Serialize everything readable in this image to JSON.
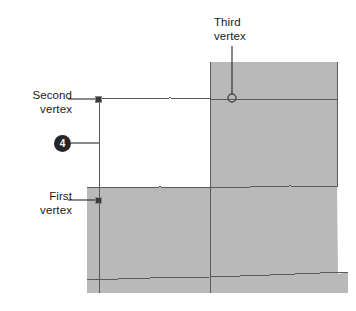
{
  "diagram": {
    "background_color": "#ffffff",
    "shape_fill_color": "#b9b9b9",
    "line_color": "#555555",
    "label_color": "#1a1a1a",
    "badge_color": "#262626",
    "badge_text_color": "#ffffff"
  },
  "labels": {
    "first_vertex": {
      "line1": "First",
      "line2": "vertex",
      "align": "right"
    },
    "second_vertex": {
      "line1": "Second",
      "line2": "vertex",
      "align": "right"
    },
    "third_vertex": {
      "line1": "Third",
      "line2": "vertex",
      "align": "left"
    }
  },
  "callouts": [
    {
      "number": "4",
      "shape": "filled-circle",
      "x": 62,
      "y": 143
    }
  ],
  "vertices": [
    {
      "name": "first-vertex",
      "marker": "filled-square",
      "x": 98,
      "y": 200
    },
    {
      "name": "second-vertex",
      "marker": "filled-square",
      "x": 98,
      "y": 99
    },
    {
      "name": "third-vertex",
      "marker": "open-circle",
      "x": 232,
      "y": 98
    }
  ]
}
